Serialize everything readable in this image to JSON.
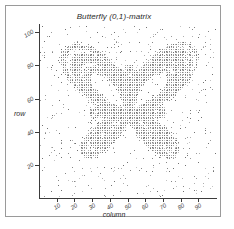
{
  "chart_data": {
    "type": "scatter",
    "title": "Butterfly (0,1)-matrix",
    "xlabel": "column",
    "ylabel": "row",
    "xlim": [
      0,
      100
    ],
    "ylim": [
      0,
      105
    ],
    "grid": false,
    "legend": null,
    "xticks": [
      10,
      20,
      30,
      40,
      50,
      60,
      70,
      80,
      90
    ],
    "yticks": [
      20,
      40,
      60,
      80,
      100
    ],
    "xtick_labels": [
      "10",
      "20",
      "30",
      "40",
      "50",
      "60",
      "70",
      "80",
      "90"
    ],
    "ytick_labels": [
      "20",
      "40",
      "60",
      "80",
      "100"
    ],
    "marker": "dot",
    "marker_size_px": 1,
    "point_color": "#555555",
    "point_count": 1900,
    "curve": {
      "name": "butterfly-curve",
      "equation": "r = exp(cos t) - 2*cos(4t) + sin((2t - pi)/24)^5",
      "t_range": [
        0,
        75.398
      ],
      "center_column": 50,
      "center_row": 52,
      "scale_x": 10.5,
      "scale_y": 10.5,
      "band_width": 0.5,
      "noise_fraction": 0.18,
      "seed": 20240517
    }
  },
  "axis": {
    "title": "Butterfly (0,1)-matrix",
    "x_axis_label": "column",
    "y_axis_label": "row"
  },
  "frame": {
    "border_color": "#9a9a9a",
    "background": "#ffffff",
    "axis_color": "#3b3b3b"
  }
}
